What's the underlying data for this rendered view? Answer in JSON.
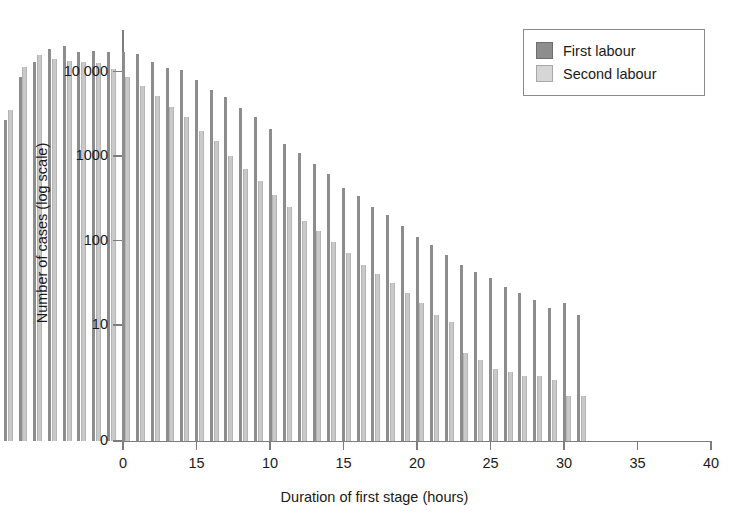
{
  "chart_data": {
    "type": "bar",
    "title": "",
    "subtitle": "",
    "xlabel": "Duration of first stage (hours)",
    "ylabel": "Number of cases (log scale)",
    "scale": "log",
    "grid": false,
    "legend_position": "top-right",
    "x": [
      1,
      2,
      3,
      4,
      5,
      6,
      7,
      8,
      9,
      10,
      11,
      12,
      13,
      14,
      15,
      16,
      17,
      18,
      19,
      20,
      21,
      22,
      23,
      24,
      25,
      26,
      27,
      28,
      29,
      30,
      31,
      32,
      33,
      34,
      35,
      36,
      37,
      38,
      39,
      40
    ],
    "xlim": [
      0,
      40
    ],
    "ylim": [
      0,
      30000
    ],
    "ytick_values": [
      0,
      10,
      100,
      1000,
      10000
    ],
    "ytick_labels": [
      "0",
      "10",
      "100",
      "1000",
      "10 000"
    ],
    "xtick_values": [
      0,
      5,
      10,
      15,
      20,
      25,
      30,
      35,
      40
    ],
    "xtick_labels": [
      "0",
      "15",
      "10",
      "15",
      "20",
      "25",
      "30",
      "35",
      "40"
    ],
    "series": [
      {
        "name": "First labour",
        "color": "#8d8d8d",
        "values": [
          2700,
          8500,
          13000,
          18500,
          20000,
          17000,
          17500,
          17200,
          16800,
          16000,
          13000,
          11000,
          10500,
          8000,
          6000,
          5000,
          3700,
          2900,
          2100,
          1400,
          1100,
          800,
          620,
          420,
          340,
          250,
          200,
          150,
          110,
          88,
          68,
          52,
          42,
          36,
          28,
          24,
          20,
          16,
          18,
          13
        ]
      },
      {
        "name": "Second labour",
        "color": "#d6d6d6",
        "values": [
          3500,
          11200,
          15500,
          14000,
          13500,
          13000,
          12500,
          10800,
          8500,
          6800,
          5200,
          3800,
          2900,
          2000,
          1500,
          1000,
          700,
          500,
          350,
          250,
          170,
          130,
          95,
          72,
          52,
          40,
          31,
          24,
          18,
          13,
          11,
          9,
          7.5,
          6,
          5.5,
          5,
          5,
          4.5,
          3,
          3
        ]
      }
    ]
  },
  "legend": {
    "items": [
      {
        "label": "First labour",
        "swatch": "first"
      },
      {
        "label": "Second labour",
        "swatch": "second"
      }
    ]
  },
  "axes": {
    "x_title": "Duration of first stage (hours)",
    "y_title": "Number of cases (log scale)"
  }
}
